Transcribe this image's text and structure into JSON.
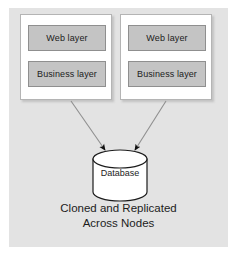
{
  "diagram": {
    "title_caption": {
      "line1": "Cloned and Replicated",
      "line2": "Across Nodes"
    },
    "panel": {
      "background_color": "#e3e3e3"
    },
    "nodes": [
      {
        "name": "node-left",
        "layers": [
          {
            "label": "Web layer"
          },
          {
            "label": "Business layer"
          }
        ]
      },
      {
        "name": "node-right",
        "layers": [
          {
            "label": "Web layer"
          },
          {
            "label": "Business layer"
          }
        ]
      }
    ],
    "database": {
      "label": "Database",
      "shape": "cylinder-icon",
      "fill_color": "#ffffff",
      "stroke_color": "#1c1c1c"
    },
    "connectors": [
      {
        "name": "arrow-left-node-to-database",
        "from": "node-left",
        "to": "database"
      },
      {
        "name": "arrow-right-node-to-database",
        "from": "node-right",
        "to": "database"
      }
    ],
    "colors": {
      "layer_fill": "#c4c4c4",
      "layer_stroke": "#8f8f8f",
      "node_fill": "#ffffff",
      "node_stroke": "#b4b4b4",
      "text": "#1c1c1c",
      "arrow": "#8a8a8a"
    }
  }
}
